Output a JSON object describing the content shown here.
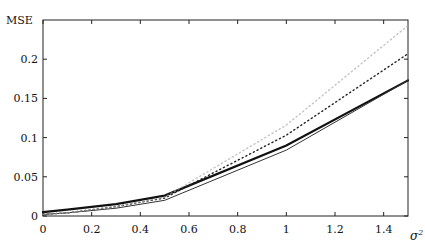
{
  "chart_data": {
    "type": "line",
    "title": "",
    "xlabel": "σ²",
    "ylabel": "MSE",
    "xlim": [
      0,
      1.5
    ],
    "ylim": [
      0,
      0.25
    ],
    "xticks": [
      "0",
      "0.2",
      "0.4",
      "0.6",
      "0.8",
      "1",
      "1.2",
      "1.4"
    ],
    "yticks": [
      "0",
      "0.05",
      "0.1",
      "0.15",
      "0.2"
    ],
    "grid": false,
    "legend": null,
    "x": [
      0,
      0.1,
      0.3,
      0.5,
      1.0,
      1.5
    ],
    "series": [
      {
        "name": "thick-solid",
        "style": "solid-thick",
        "color": "#111111",
        "values": [
          0.005,
          0.008,
          0.015,
          0.026,
          0.09,
          0.173
        ]
      },
      {
        "name": "thin-solid",
        "style": "solid-thin",
        "color": "#333333",
        "values": [
          0.002,
          0.004,
          0.01,
          0.02,
          0.084,
          0.173
        ]
      },
      {
        "name": "dark-dotted",
        "style": "dotted",
        "color": "#222222",
        "values": [
          0.002,
          0.004,
          0.012,
          0.023,
          0.103,
          0.207
        ]
      },
      {
        "name": "light-dotted",
        "style": "dotted-light",
        "color": "#aaaaaa",
        "values": [
          0.002,
          0.004,
          0.012,
          0.024,
          0.116,
          0.243
        ]
      }
    ]
  }
}
